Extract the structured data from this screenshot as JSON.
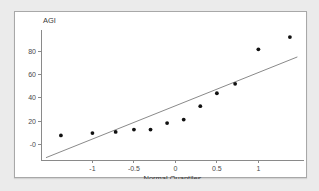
{
  "clipped_top_text": "",
  "chart_data": {
    "type": "scatter",
    "title": "",
    "xlabel": "Normal Quantiles",
    "ylabel": "AGI",
    "xlim": [
      -1.62,
      1.55
    ],
    "ylim": [
      -13,
      98
    ],
    "grid": false,
    "legend": false,
    "xticks": [
      -1,
      -0.5,
      0,
      0.5,
      1
    ],
    "xticklabels": [
      "-1",
      "-0.5",
      "0",
      "0.5",
      "1"
    ],
    "yticks": [
      0,
      20,
      40,
      60,
      80
    ],
    "yticklabels": [
      "-0",
      "20",
      "40",
      "60",
      "80"
    ],
    "point_color": "#111111",
    "line_color": "#8a8a8a",
    "axis_color": "#8a8a8a",
    "x": [
      -1.38,
      -1.0,
      -0.72,
      -0.5,
      -0.3,
      -0.1,
      0.1,
      0.3,
      0.5,
      0.72,
      1.0,
      1.38
    ],
    "y": [
      8,
      10,
      11,
      13,
      13,
      18.5,
      21.5,
      33,
      44,
      52,
      81.5,
      92
    ],
    "reference_line": {
      "name": "normal reference line",
      "x": [
        -1.56,
        1.47
      ],
      "y": [
        -11,
        75
      ]
    }
  }
}
